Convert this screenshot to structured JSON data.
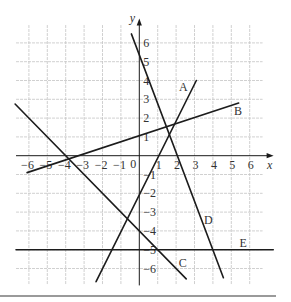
{
  "chart_data": {
    "type": "line",
    "title": "",
    "xlabel": "x",
    "ylabel": "y",
    "xlim": [
      -6.7,
      7.3
    ],
    "ylim": [
      -6.9,
      7.3
    ],
    "grid": true,
    "x_ticks": [
      {
        "value": -6,
        "label": "−6"
      },
      {
        "value": -5,
        "label": "−5"
      },
      {
        "value": -4,
        "label": "−4"
      },
      {
        "value": -3,
        "label": "−3"
      },
      {
        "value": -2,
        "label": "−2"
      },
      {
        "value": -1,
        "label": "−1"
      },
      {
        "value": 0,
        "label": "0"
      },
      {
        "value": 1,
        "label": "1"
      },
      {
        "value": 2,
        "label": "2"
      },
      {
        "value": 3,
        "label": "3"
      },
      {
        "value": 4,
        "label": "4"
      },
      {
        "value": 5,
        "label": "5"
      },
      {
        "value": 6,
        "label": "6"
      }
    ],
    "y_ticks": [
      {
        "value": 6,
        "label": "6"
      },
      {
        "value": 5,
        "label": "5"
      },
      {
        "value": 4,
        "label": "4"
      },
      {
        "value": 3,
        "label": "3"
      },
      {
        "value": 2,
        "label": "2"
      },
      {
        "value": 1,
        "label": "1"
      },
      {
        "value": -1,
        "label": "−1"
      },
      {
        "value": -2,
        "label": "−2"
      },
      {
        "value": -3,
        "label": "−3"
      },
      {
        "value": -4,
        "label": "−4"
      },
      {
        "value": -5,
        "label": "−5"
      },
      {
        "value": -6,
        "label": "−6"
      }
    ],
    "series": [
      {
        "name": "A",
        "points": [
          [
            -2.35,
            -6.7
          ],
          [
            3.1,
            4.0
          ]
        ],
        "label_pos": [
          2.39,
          3.64
        ]
      },
      {
        "name": "B",
        "points": [
          [
            -6.1,
            -0.9
          ],
          [
            5.4,
            2.8
          ]
        ],
        "label_pos": [
          5.36,
          2.38
        ]
      },
      {
        "name": "C",
        "points": [
          [
            -6.75,
            2.75
          ],
          [
            2.55,
            -6.55
          ]
        ],
        "label_pos": [
          2.36,
          -5.72
        ]
      },
      {
        "name": "D",
        "points": [
          [
            -0.43,
            6.48
          ],
          [
            4.57,
            -6.49
          ]
        ],
        "label_pos": [
          3.75,
          -3.42
        ]
      },
      {
        "name": "E",
        "points": [
          [
            -6.7,
            -5
          ],
          [
            7.28,
            -5
          ]
        ],
        "label_pos": [
          5.65,
          -4.66
        ]
      }
    ]
  }
}
